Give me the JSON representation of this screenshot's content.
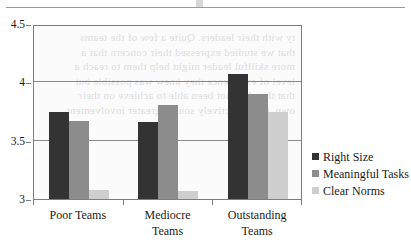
{
  "figure": {
    "top_rule": "horizontal-rule",
    "ghost_text": "ty with their leaders. Quite a few of the teams\nthat we studied expressed their concern that a\nmore skillful leader might help them to reach a\nlevel of excellence they knew was possible but\nthat they had not been able to achieve on their\nown. Others actively sought greater involvement"
  },
  "chart_data": {
    "type": "bar",
    "title": "",
    "xlabel": "",
    "ylabel": "",
    "categories": [
      "Poor Teams",
      "Mediocre\nTeams",
      "Outstanding\nTeams"
    ],
    "series": [
      {
        "name": "Right Size",
        "color": "#333333",
        "values": [
          3.75,
          3.66,
          4.07
        ]
      },
      {
        "name": "Meaningful Tasks",
        "color": "#8c8c8c",
        "values": [
          3.67,
          3.81,
          3.9
        ]
      },
      {
        "name": "Clear Norms",
        "color": "#cfcfcf",
        "values": [
          3.08,
          3.07,
          3.75
        ]
      }
    ],
    "ylim": [
      3,
      4.5
    ],
    "yticks": [
      3,
      3.5,
      4,
      4.5
    ],
    "ytick_labels": [
      "3",
      "3.5",
      "4",
      "4.5"
    ],
    "grid": true,
    "legend_position": "right"
  }
}
